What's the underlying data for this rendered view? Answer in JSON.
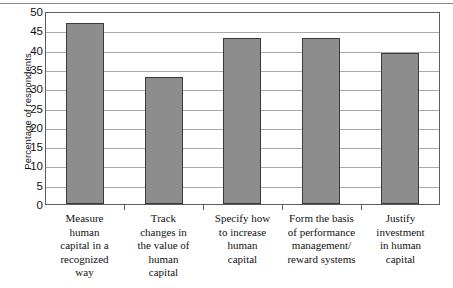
{
  "chart_data": {
    "type": "bar",
    "title": "",
    "xlabel": "",
    "ylabel": "Percentage of respondents",
    "ylim": [
      0,
      50
    ],
    "ytick_step": 5,
    "grid": true,
    "legend": "none",
    "orientation": "vertical",
    "bar_color": "#8d8d8d",
    "bar_edge_color": "#3a3a3a",
    "gridline_color": "#a9a9a9",
    "axis_color": "#5d5d5d",
    "categories": [
      "Measure\nhuman\ncapital in a\nrecognized\nway",
      "Track\nchanges in\nthe value of\nhuman\ncapital",
      "Specify how\nto increase\nhuman\ncapital",
      "Form the basis\nof performance\nmanagement/\nreward systems",
      "Justify\ninvestment\nin human\ncapital"
    ],
    "values": [
      47,
      33,
      43,
      43,
      39
    ],
    "ytick_labels": [
      "0",
      "5",
      "10",
      "15",
      "20",
      "25",
      "30",
      "35",
      "40",
      "45",
      "50"
    ],
    "ytick_values": [
      0,
      5,
      10,
      15,
      20,
      25,
      30,
      35,
      40,
      45,
      50
    ]
  }
}
